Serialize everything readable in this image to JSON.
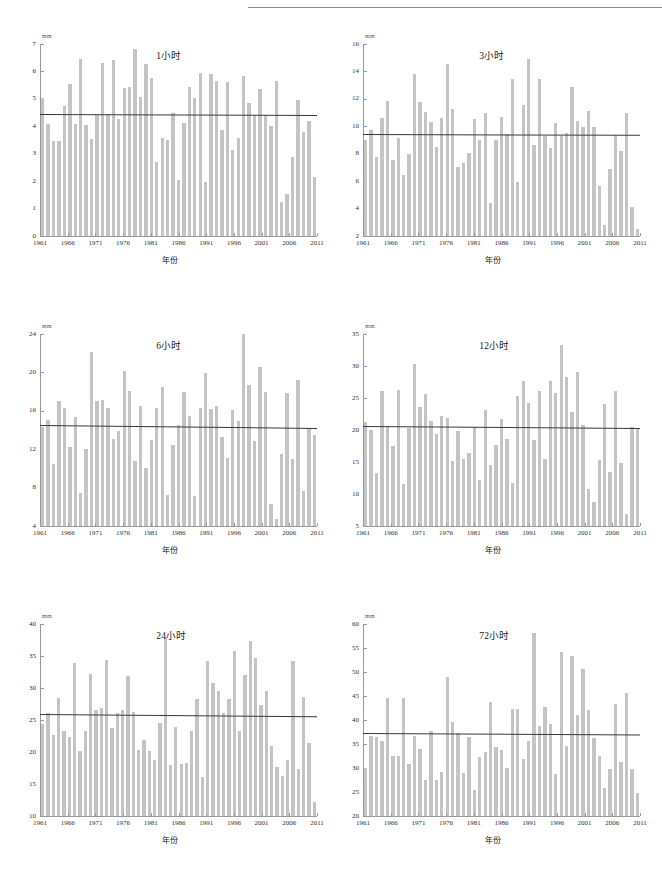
{
  "figure": {
    "unit_label": "mm",
    "xlabel": "年份",
    "bar_color": "#c4c4c4",
    "trend_color": "#3a3a3a",
    "axis_color": "#9a9a9a"
  },
  "chart_data": [
    {
      "type": "bar",
      "title": "1小时",
      "xlabel": "年份",
      "ylabel": "mm",
      "ylim": [
        0,
        7
      ],
      "ytick_step": 1,
      "yticks": [
        0,
        1,
        2,
        3,
        4,
        5,
        6,
        7
      ],
      "xlim": [
        1961,
        2011
      ],
      "xticks": [
        1961,
        1966,
        1971,
        1976,
        1981,
        1986,
        1991,
        1996,
        2001,
        2006,
        2011
      ],
      "grid": false,
      "legend": "none",
      "mean_line": 4.45,
      "trend_start": 4.46,
      "trend_end": 4.42,
      "categories": [
        1961,
        1962,
        1963,
        1964,
        1965,
        1966,
        1967,
        1968,
        1969,
        1970,
        1971,
        1972,
        1973,
        1974,
        1975,
        1976,
        1977,
        1978,
        1979,
        1980,
        1981,
        1982,
        1983,
        1984,
        1985,
        1986,
        1987,
        1988,
        1989,
        1990,
        1991,
        1992,
        1993,
        1994,
        1995,
        1996,
        1997,
        1998,
        1999,
        2000,
        2001,
        2002,
        2003,
        2004,
        2005,
        2006,
        2007,
        2008,
        2009,
        2010,
        2011
      ],
      "values": [
        5.02,
        4.08,
        3.46,
        3.48,
        4.74,
        5.53,
        4.09,
        6.44,
        4.05,
        3.52,
        4.42,
        6.31,
        4.43,
        6.4,
        4.26,
        5.38,
        5.42,
        6.82,
        5.05,
        6.27,
        5.75,
        2.7,
        3.56,
        3.51,
        4.5,
        2.05,
        4.13,
        5.45,
        5.04,
        5.93,
        1.97,
        5.92,
        5.64,
        3.86,
        5.6,
        3.15,
        3.56,
        5.84,
        4.84,
        4.42,
        5.36,
        4.4,
        4.0,
        5.65,
        1.24,
        1.52,
        2.87,
        4.97,
        3.79,
        4.21,
        2.16
      ]
    },
    {
      "type": "bar",
      "title": "3小时",
      "xlabel": "年份",
      "ylabel": "mm",
      "ylim": [
        2,
        16
      ],
      "ytick_step": 2,
      "yticks": [
        2,
        4,
        6,
        8,
        10,
        12,
        14,
        16
      ],
      "xlim": [
        1961,
        2011
      ],
      "xticks": [
        1961,
        1966,
        1971,
        1976,
        1981,
        1986,
        1991,
        1996,
        2001,
        2006,
        2011
      ],
      "grid": false,
      "legend": "none",
      "mean_line": 9.4,
      "trend_start": 9.42,
      "trend_end": 9.36,
      "categories": [
        1961,
        1962,
        1963,
        1964,
        1965,
        1966,
        1967,
        1968,
        1969,
        1970,
        1971,
        1972,
        1973,
        1974,
        1975,
        1976,
        1977,
        1978,
        1979,
        1980,
        1981,
        1982,
        1983,
        1984,
        1985,
        1986,
        1987,
        1988,
        1989,
        1990,
        1991,
        1992,
        1993,
        1994,
        1995,
        1996,
        1997,
        1998,
        1999,
        2000,
        2001,
        2002,
        2003,
        2004,
        2005,
        2006,
        2007,
        2008,
        2009,
        2010,
        2011
      ],
      "values": [
        9.02,
        9.75,
        7.76,
        10.57,
        11.82,
        7.57,
        9.13,
        6.47,
        7.95,
        13.78,
        11.76,
        11.05,
        10.32,
        8.52,
        10.62,
        14.53,
        11.24,
        7.03,
        7.3,
        8.08,
        10.5,
        8.97,
        11.0,
        4.44,
        8.98,
        10.65,
        9.42,
        13.46,
        5.95,
        11.53,
        14.93,
        8.66,
        13.43,
        9.32,
        8.41,
        10.24,
        9.32,
        9.52,
        12.84,
        10.38,
        9.92,
        11.15,
        9.98,
        5.62,
        2.82,
        6.9,
        9.34,
        8.22,
        11.0,
        4.15,
        2.48
      ]
    },
    {
      "type": "bar",
      "title": "6小时",
      "xlabel": "年份",
      "ylabel": "mm",
      "ylim": [
        4,
        24
      ],
      "ytick_step": 4,
      "yticks": [
        4,
        8,
        12,
        16,
        20,
        24
      ],
      "xlim": [
        1961,
        2011
      ],
      "xticks": [
        1961,
        1966,
        1971,
        1976,
        1981,
        1986,
        1991,
        1996,
        2001,
        2006,
        2011
      ],
      "grid": false,
      "legend": "none",
      "mean_line": 14.4,
      "trend_start": 14.55,
      "trend_end": 14.25,
      "categories": [
        1961,
        1962,
        1963,
        1964,
        1965,
        1966,
        1967,
        1968,
        1969,
        1970,
        1971,
        1972,
        1973,
        1974,
        1975,
        1976,
        1977,
        1978,
        1979,
        1980,
        1981,
        1982,
        1983,
        1984,
        1985,
        1986,
        1987,
        1988,
        1989,
        1990,
        1991,
        1992,
        1993,
        1994,
        1995,
        1996,
        1997,
        1998,
        1999,
        2000,
        2001,
        2002,
        2003,
        2004,
        2005,
        2006,
        2007,
        2008,
        2009,
        2010,
        2011
      ],
      "values": [
        14.35,
        15.05,
        10.45,
        17.0,
        16.3,
        12.2,
        15.35,
        7.45,
        12.05,
        22.15,
        17.05,
        17.15,
        16.25,
        13.05,
        13.85,
        20.1,
        18.05,
        10.75,
        16.55,
        10.05,
        13.0,
        16.3,
        18.45,
        7.25,
        12.45,
        14.55,
        18.0,
        15.45,
        7.1,
        16.25,
        19.9,
        16.15,
        16.45,
        13.25,
        11.05,
        16.05,
        14.95,
        23.95,
        18.65,
        12.9,
        20.55,
        18.0,
        6.3,
        4.75,
        11.55,
        17.85,
        11.0,
        19.2,
        7.65,
        14.2,
        13.5
      ]
    },
    {
      "type": "bar",
      "title": "12小时",
      "xlabel": "年份",
      "ylabel": "mm",
      "ylim": [
        5,
        35
      ],
      "ytick_step": 5,
      "yticks": [
        5,
        10,
        15,
        20,
        25,
        30,
        35
      ],
      "xlim": [
        1961,
        2011
      ],
      "xticks": [
        1961,
        1966,
        1971,
        1976,
        1981,
        1986,
        1991,
        1996,
        2001,
        2006,
        2011
      ],
      "grid": false,
      "legend": "none",
      "mean_line": 20.4,
      "trend_start": 20.55,
      "trend_end": 20.25,
      "categories": [
        1961,
        1962,
        1963,
        1964,
        1965,
        1966,
        1967,
        1968,
        1969,
        1970,
        1971,
        1972,
        1973,
        1974,
        1975,
        1976,
        1977,
        1978,
        1979,
        1980,
        1981,
        1982,
        1983,
        1984,
        1985,
        1986,
        1987,
        1988,
        1989,
        1990,
        1991,
        1992,
        1993,
        1994,
        1995,
        1996,
        1997,
        1998,
        1999,
        2000,
        2001,
        2002,
        2003,
        2004,
        2005,
        2006,
        2007,
        2008,
        2009,
        2010,
        2011
      ],
      "values": [
        21.3,
        20.05,
        13.25,
        26.15,
        20.55,
        17.55,
        26.2,
        11.6,
        20.35,
        30.35,
        23.6,
        25.6,
        21.45,
        19.35,
        22.25,
        21.8,
        15.2,
        19.85,
        15.45,
        16.4,
        20.5,
        12.15,
        23.05,
        14.5,
        17.7,
        21.75,
        18.55,
        11.75,
        25.25,
        27.6,
        24.25,
        18.45,
        26.1,
        15.4,
        27.6,
        25.8,
        33.25,
        28.25,
        22.75,
        29.1,
        20.85,
        10.8,
        8.8,
        15.25,
        24.05,
        13.4,
        26.15,
        14.85,
        6.9,
        20.5,
        20.2
      ]
    },
    {
      "type": "bar",
      "title": "24小时",
      "xlabel": "年份",
      "ylabel": "mm",
      "ylim": [
        10,
        40
      ],
      "ytick_step": 5,
      "yticks": [
        10,
        15,
        20,
        25,
        30,
        35,
        40
      ],
      "xlim": [
        1961,
        2011
      ],
      "xticks": [
        1961,
        1966,
        1971,
        1976,
        1981,
        1986,
        1991,
        1996,
        2001,
        2006,
        2011
      ],
      "grid": false,
      "legend": "none",
      "mean_line": 25.8,
      "trend_start": 25.95,
      "trend_end": 25.6,
      "categories": [
        1961,
        1962,
        1963,
        1964,
        1965,
        1966,
        1967,
        1968,
        1969,
        1970,
        1971,
        1972,
        1973,
        1974,
        1975,
        1976,
        1977,
        1978,
        1979,
        1980,
        1981,
        1982,
        1983,
        1984,
        1985,
        1986,
        1987,
        1988,
        1989,
        1990,
        1991,
        1992,
        1993,
        1994,
        1995,
        1996,
        1997,
        1998,
        1999,
        2000,
        2001,
        2002,
        2003,
        2004,
        2005,
        2006,
        2007,
        2008,
        2009,
        2010,
        2011
      ],
      "values": [
        24.35,
        26.1,
        22.65,
        28.45,
        23.3,
        22.35,
        33.95,
        20.15,
        23.35,
        32.25,
        26.55,
        26.8,
        34.35,
        23.75,
        26.15,
        26.55,
        31.95,
        26.25,
        20.25,
        21.85,
        20.15,
        18.7,
        24.5,
        37.85,
        17.9,
        23.95,
        18.1,
        18.25,
        23.35,
        28.35,
        16.1,
        34.25,
        30.75,
        29.55,
        26.1,
        28.25,
        35.85,
        23.35,
        32.1,
        37.35,
        34.75,
        27.3,
        29.55,
        20.95,
        17.7,
        16.2,
        18.8,
        34.15,
        17.3,
        28.65,
        21.45,
        12.15
      ]
    },
    {
      "type": "bar",
      "title": "72小时",
      "xlabel": "年份",
      "ylabel": "mm",
      "ylim": [
        20,
        60
      ],
      "ytick_step": 5,
      "yticks": [
        20,
        25,
        30,
        35,
        40,
        45,
        50,
        55,
        60
      ],
      "xlim": [
        1961,
        2011
      ],
      "xticks": [
        1961,
        1966,
        1971,
        1976,
        1981,
        1986,
        1991,
        1996,
        2001,
        2006,
        2011
      ],
      "grid": false,
      "legend": "none",
      "mean_line": 37.1,
      "trend_start": 37.25,
      "trend_end": 36.95,
      "categories": [
        1961,
        1962,
        1963,
        1964,
        1965,
        1966,
        1967,
        1968,
        1969,
        1970,
        1971,
        1972,
        1973,
        1974,
        1975,
        1976,
        1977,
        1978,
        1979,
        1980,
        1981,
        1982,
        1983,
        1984,
        1985,
        1986,
        1987,
        1988,
        1989,
        1990,
        1991,
        1992,
        1993,
        1994,
        1995,
        1996,
        1997,
        1998,
        1999,
        2000,
        2001,
        2002,
        2003,
        2004,
        2005,
        2006,
        2007,
        2008,
        2009,
        2010,
        2011
      ],
      "values": [
        30.1,
        36.6,
        36.5,
        35.55,
        44.6,
        32.4,
        32.55,
        44.5,
        30.9,
        36.6,
        33.9,
        27.45,
        37.75,
        27.5,
        29.2,
        48.9,
        39.65,
        37.2,
        29.0,
        36.4,
        25.45,
        32.25,
        33.3,
        43.7,
        34.4,
        33.75,
        30.05,
        42.25,
        42.25,
        31.9,
        35.55,
        58.1,
        38.65,
        42.65,
        39.15,
        28.85,
        54.25,
        34.5,
        53.35,
        41.0,
        50.65,
        42.0,
        36.2,
        32.55,
        25.8,
        29.8,
        43.3,
        31.25,
        45.6,
        29.75,
        24.75
      ]
    }
  ]
}
